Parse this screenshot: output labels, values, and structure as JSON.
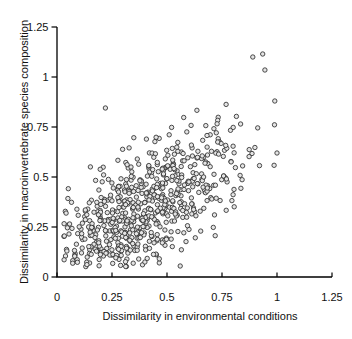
{
  "figure": {
    "background": "#ffffff"
  },
  "chart_data": {
    "type": "scatter",
    "title": "",
    "xlabel": "Dissimilarity in environmental conditions",
    "ylabel": "Dissimilarity in macroinvertebrate species composition",
    "xlim": [
      0,
      1.25
    ],
    "ylim": [
      0,
      1.25
    ],
    "xticks": {
      "values": [
        0,
        0.25,
        0.5,
        0.75,
        1,
        1.25
      ],
      "labels": [
        "0",
        "0.25",
        "0.5",
        "0.75",
        "1",
        "1.25"
      ]
    },
    "yticks": {
      "values": [
        0,
        0.25,
        0.5,
        0.75,
        1,
        1.25
      ],
      "labels": [
        "0",
        "0.25",
        "0.5",
        "0.75",
        "1",
        "1.25"
      ]
    },
    "grid": false,
    "legend": "none",
    "axis_color": "#000000",
    "marker": {
      "shape": "open-circle",
      "fill": "#e4e4e4",
      "stroke": "#2d2d2d",
      "stroke_width": 0.85,
      "radius_px": 2.2
    },
    "n_points": 668,
    "relationship": "positive correlation: species-composition dissimilarity increases with environmental dissimilarity",
    "x_data_range": [
      0.03,
      1.02
    ],
    "y_data_range": [
      0.05,
      1.12
    ],
    "point_cloud": {
      "seed": 20,
      "n": 660,
      "x_mean": 0.4,
      "x_sd": 0.21,
      "x_min": 0.03,
      "x_max": 1.02,
      "slope": 0.62,
      "intercept": 0.1,
      "noise_sd": 0.135,
      "y_min": 0.05,
      "y_max": 1.1
    },
    "notable_points": [
      [
        0.22,
        0.845
      ],
      [
        0.89,
        1.1
      ],
      [
        0.935,
        1.115
      ],
      [
        0.945,
        1.035
      ],
      [
        0.99,
        0.88
      ],
      [
        1.0,
        0.62
      ],
      [
        0.56,
        0.055
      ],
      [
        0.045,
        0.13
      ]
    ]
  }
}
